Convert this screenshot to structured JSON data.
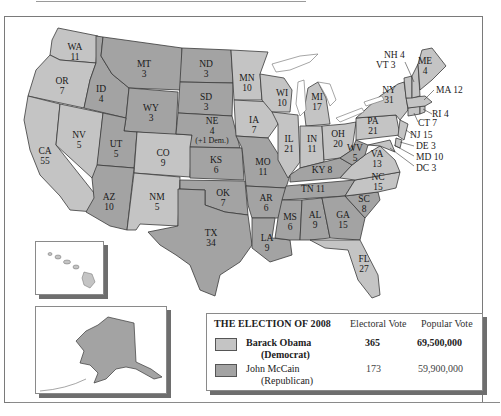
{
  "colors": {
    "democrat_fill": "#c4c4c4",
    "republican_fill": "#a3a3a3",
    "border": "#3a3a3a",
    "water": "#ffffff"
  },
  "states": [
    {
      "abbr": "WA",
      "votes": "11",
      "winner": "D"
    },
    {
      "abbr": "OR",
      "votes": "7",
      "winner": "D"
    },
    {
      "abbr": "CA",
      "votes": "55",
      "winner": "D"
    },
    {
      "abbr": "ID",
      "votes": "4",
      "winner": "R"
    },
    {
      "abbr": "NV",
      "votes": "5",
      "winner": "D"
    },
    {
      "abbr": "MT",
      "votes": "3",
      "winner": "R"
    },
    {
      "abbr": "WY",
      "votes": "3",
      "winner": "R"
    },
    {
      "abbr": "UT",
      "votes": "5",
      "winner": "R"
    },
    {
      "abbr": "CO",
      "votes": "9",
      "winner": "D"
    },
    {
      "abbr": "AZ",
      "votes": "10",
      "winner": "R"
    },
    {
      "abbr": "NM",
      "votes": "5",
      "winner": "D"
    },
    {
      "abbr": "ND",
      "votes": "3",
      "winner": "R"
    },
    {
      "abbr": "SD",
      "votes": "3",
      "winner": "R"
    },
    {
      "abbr": "NE",
      "votes": "4",
      "note": "(+1 Dem.)",
      "winner": "R"
    },
    {
      "abbr": "KS",
      "votes": "6",
      "winner": "R"
    },
    {
      "abbr": "OK",
      "votes": "7",
      "winner": "R"
    },
    {
      "abbr": "TX",
      "votes": "34",
      "winner": "R"
    },
    {
      "abbr": "MN",
      "votes": "10",
      "winner": "D"
    },
    {
      "abbr": "IA",
      "votes": "7",
      "winner": "D"
    },
    {
      "abbr": "MO",
      "votes": "11",
      "winner": "R"
    },
    {
      "abbr": "AR",
      "votes": "6",
      "winner": "R"
    },
    {
      "abbr": "LA",
      "votes": "9",
      "winner": "R"
    },
    {
      "abbr": "WI",
      "votes": "10",
      "winner": "D"
    },
    {
      "abbr": "IL",
      "votes": "21",
      "winner": "D"
    },
    {
      "abbr": "MI",
      "votes": "17",
      "winner": "D"
    },
    {
      "abbr": "IN",
      "votes": "11",
      "winner": "D"
    },
    {
      "abbr": "OH",
      "votes": "20",
      "winner": "D"
    },
    {
      "abbr": "KY",
      "votes": "8",
      "winner": "R"
    },
    {
      "abbr": "TN",
      "votes": "11",
      "winner": "R"
    },
    {
      "abbr": "MS",
      "votes": "6",
      "winner": "R"
    },
    {
      "abbr": "AL",
      "votes": "9",
      "winner": "R"
    },
    {
      "abbr": "GA",
      "votes": "15",
      "winner": "R"
    },
    {
      "abbr": "FL",
      "votes": "27",
      "winner": "D"
    },
    {
      "abbr": "SC",
      "votes": "8",
      "winner": "R"
    },
    {
      "abbr": "NC",
      "votes": "15",
      "winner": "D"
    },
    {
      "abbr": "VA",
      "votes": "13",
      "winner": "D"
    },
    {
      "abbr": "WV",
      "votes": "5",
      "winner": "R"
    },
    {
      "abbr": "PA",
      "votes": "21",
      "winner": "D"
    },
    {
      "abbr": "NY",
      "votes": "31",
      "winner": "D"
    },
    {
      "abbr": "ME",
      "votes": "4",
      "winner": "D"
    },
    {
      "abbr": "NH",
      "votes": "4",
      "winner": "D"
    },
    {
      "abbr": "VT",
      "votes": "3",
      "winner": "D"
    },
    {
      "abbr": "MA",
      "votes": "12",
      "winner": "D"
    },
    {
      "abbr": "RI",
      "votes": "4",
      "winner": "D"
    },
    {
      "abbr": "CT",
      "votes": "7",
      "winner": "D"
    },
    {
      "abbr": "NJ",
      "votes": "15",
      "winner": "D"
    },
    {
      "abbr": "DE",
      "votes": "3",
      "winner": "D"
    },
    {
      "abbr": "MD",
      "votes": "10",
      "winner": "D"
    },
    {
      "abbr": "DC",
      "votes": "3",
      "winner": "D"
    },
    {
      "abbr": "HI",
      "votes": "4",
      "winner": "D"
    },
    {
      "abbr": "AK",
      "votes": "3",
      "winner": "R"
    }
  ],
  "labels": {
    "WA": "WA",
    "WA_v": "11",
    "OR": "OR",
    "OR_v": "7",
    "CA": "CA",
    "CA_v": "55",
    "ID": "ID",
    "ID_v": "4",
    "NV": "NV",
    "NV_v": "5",
    "MT": "MT",
    "MT_v": "3",
    "WY": "WY",
    "WY_v": "3",
    "UT": "UT",
    "UT_v": "5",
    "CO": "CO",
    "CO_v": "9",
    "AZ": "AZ",
    "AZ_v": "10",
    "NM": "NM",
    "NM_v": "5",
    "ND": "ND",
    "ND_v": "3",
    "SD": "SD",
    "SD_v": "3",
    "NE": "NE",
    "NE_v": "4",
    "NE_note": "(+1 Dem.)",
    "KS": "KS",
    "KS_v": "6",
    "OK": "OK",
    "OK_v": "7",
    "TX": "TX",
    "TX_v": "34",
    "MN": "MN",
    "MN_v": "10",
    "IA": "IA",
    "IA_v": "7",
    "MO": "MO",
    "MO_v": "11",
    "AR": "AR",
    "AR_v": "6",
    "LA": "LA",
    "LA_v": "9",
    "WI": "WI",
    "WI_v": "10",
    "IL": "IL",
    "IL_v": "21",
    "MI": "MI",
    "MI_v": "17",
    "IN": "IN",
    "IN_v": "11",
    "OH": "OH",
    "OH_v": "20",
    "KY": "KY 8",
    "TN": "TN 11",
    "MS": "MS",
    "MS_v": "6",
    "AL": "AL",
    "AL_v": "9",
    "GA": "GA",
    "GA_v": "15",
    "FL": "FL",
    "FL_v": "27",
    "SC": "SC",
    "SC_v": "8",
    "NC": "NC",
    "NC_v": "15",
    "VA": "VA",
    "VA_v": "13",
    "WV": "WV",
    "WV_v": "5",
    "PA": "PA",
    "PA_v": "21",
    "NY": "NY",
    "NY_v": "31",
    "ME": "ME",
    "ME_v": "4",
    "NH": "NH 4",
    "VT": "VT 3",
    "MA": "MA 12",
    "RI": "RI 4",
    "CT": "CT 7",
    "NJ": "NJ 15",
    "DE": "DE 3",
    "MD": "MD 10",
    "DC": "DC 3",
    "HI": "HI",
    "HI_v": "4",
    "AK": "AK",
    "AK_v": "3"
  },
  "legend": {
    "title": "THE ELECTION OF 2008",
    "col_electoral": "Electoral Vote",
    "col_popular": "Popular Vote",
    "candidates": [
      {
        "name": "Barack Obama",
        "party": "(Democrat)",
        "electoral": "365",
        "popular": "69,500,000",
        "winner": true
      },
      {
        "name": "John McCain",
        "party": "(Republican)",
        "electoral": "173",
        "popular": "59,900,000",
        "winner": false
      }
    ]
  }
}
